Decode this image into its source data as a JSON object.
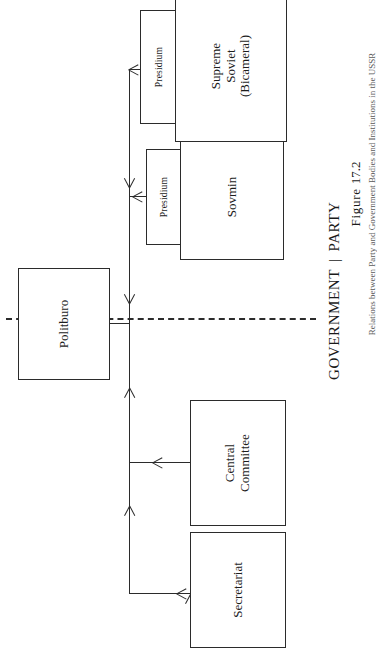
{
  "figure": {
    "label": "Figure",
    "number": "17.2",
    "caption": "Relations between Party and Government Bodies and Institutions in the USSR"
  },
  "divider": {
    "government_label": "GOVERNMENT",
    "separator": "|",
    "party_label": "PARTY",
    "style": "dashed"
  },
  "diagram": {
    "orientation": "rotated-90-ccw",
    "boxes": [
      {
        "id": "politburo",
        "label": "Politburo",
        "side": "party"
      },
      {
        "id": "central-committee",
        "label": "Central\nCommittee",
        "side": "party"
      },
      {
        "id": "secretariat",
        "label": "Secretariat",
        "side": "party"
      },
      {
        "id": "sovmin",
        "label": "Sovmin",
        "side": "government"
      },
      {
        "id": "supreme-soviet",
        "label": "Supreme\nSoviet\n(Bicameral)",
        "side": "government"
      }
    ],
    "presidium_tabs": [
      {
        "id": "presidium-sovmin",
        "label": "Presidium",
        "attached_to": "sovmin"
      },
      {
        "id": "presidium-supreme-soviet",
        "label": "Presidium",
        "attached_to": "supreme-soviet"
      }
    ],
    "connections": [
      {
        "from": "politburo",
        "to": "spine",
        "arrow": "into-spine"
      },
      {
        "from": "spine",
        "to": "central-committee",
        "arrow": "single"
      },
      {
        "from": "spine",
        "to": "secretariat",
        "arrow": "single"
      },
      {
        "from": "spine",
        "to": "sovmin",
        "arrow": "single"
      },
      {
        "from": "spine",
        "to": "supreme-soviet",
        "arrow": "single"
      }
    ]
  },
  "colors": {
    "ink": "#2b2b2b",
    "page": "#ffffff",
    "caption_ink": "#5a5a5a"
  }
}
